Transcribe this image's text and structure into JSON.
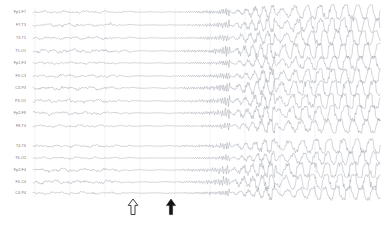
{
  "recording": {
    "modality": "EEG",
    "montage": "bipolar longitudinal (double banana)",
    "trace_color": "#8a8f99",
    "grid_color": "#cdd3da",
    "background_color": "#ffffff",
    "label_color": "#6d7480"
  },
  "channels": [
    {
      "label": "Fp1-F7",
      "group": "left-temporal"
    },
    {
      "label": "F7-T3",
      "group": "left-temporal"
    },
    {
      "label": "T3-T5",
      "group": "left-temporal"
    },
    {
      "label": "T5-O1",
      "group": "left-temporal"
    },
    {
      "label": "Fp1-F3",
      "group": "left-parasagittal"
    },
    {
      "label": "F3-C3",
      "group": "left-parasagittal"
    },
    {
      "label": "C3-P3",
      "group": "left-parasagittal"
    },
    {
      "label": "P3-O1",
      "group": "left-parasagittal"
    },
    {
      "label": "Fp2-F8",
      "group": "right-temporal"
    },
    {
      "label": "F8-T4",
      "group": "right-temporal"
    },
    {
      "label": "T4-T6",
      "group": "right-temporal"
    },
    {
      "label": "T6-O2",
      "group": "right-temporal"
    },
    {
      "label": "Fp2-F4",
      "group": "right-parasagittal"
    },
    {
      "label": "F4-C4",
      "group": "right-parasagittal"
    },
    {
      "label": "C4-P4",
      "group": "right-parasagittal"
    },
    {
      "label": "P4-O2",
      "group": "right-parasagittal"
    },
    {
      "label": "Fz-Cz",
      "group": "midline"
    },
    {
      "label": "Cz-Pz",
      "group": "midline"
    }
  ],
  "annotations": [
    {
      "name": "open-arrow-marker",
      "style": "hollow-up-arrow",
      "x": 133,
      "meaning": "electrodecremental onset"
    },
    {
      "name": "solid-arrow-marker",
      "style": "solid-up-arrow",
      "x": 171,
      "meaning": "electrographic seizure onset"
    }
  ],
  "chart_data": {
    "type": "line",
    "title": "",
    "xlabel": "",
    "ylabel": "",
    "n_channels": 15,
    "grid": true,
    "grid_x_positions": [
      35,
      70,
      105,
      140,
      175,
      210,
      245,
      280,
      315,
      350
    ],
    "x_range": [
      33,
      380
    ],
    "plot_top": 10,
    "plot_bottom": 196,
    "row_pitch": 12.3,
    "group_gap_after_row": 10,
    "group_gap_px": 7,
    "label_rows": [
      {
        "label": "Fp1-F7",
        "y": 12
      },
      {
        "label": "F7-T3",
        "y": 25
      },
      {
        "label": "T3-T5",
        "y": 38
      },
      {
        "label": "T5-O1",
        "y": 51
      },
      {
        "label": "Fp1-F3",
        "y": 63
      },
      {
        "label": "F3-C3",
        "y": 76
      },
      {
        "label": "C3-P3",
        "y": 88
      },
      {
        "label": "P3-O1",
        "y": 101
      },
      {
        "label": "Fp2-F8",
        "y": 113
      },
      {
        "label": "F8-T4",
        "y": 126
      },
      {
        "label": "T4-T6",
        "y": 146
      },
      {
        "label": "T6-O2",
        "y": 158
      },
      {
        "label": "Fp2-F4",
        "y": 170
      },
      {
        "label": "F4-C4",
        "y": 182
      },
      {
        "label": "C4-P4",
        "y": 193
      }
    ],
    "epochs": [
      {
        "name": "pre-ictal background",
        "x_start": 33,
        "x_end": 128,
        "amplitude": 1.9,
        "description": "low-amplitude mixed-frequency background activity"
      },
      {
        "name": "electrodecrement",
        "x_start": 128,
        "x_end": 171,
        "amplitude": 0.45,
        "description": "voltage attenuation / flattening following hollow arrow"
      },
      {
        "name": "low-voltage fast activity",
        "x_start": 171,
        "x_end": 230,
        "amplitude": 1.3,
        "description": "rhythmic fast activity emerging at seizure onset"
      },
      {
        "name": "rhythmic evolution",
        "x_start": 230,
        "x_end": 275,
        "amplitude": 3.2,
        "description": "build-up of rhythmic discharges with increasing amplitude"
      },
      {
        "name": "organized ictal rhythm",
        "x_start": 275,
        "x_end": 380,
        "amplitude": 5.0,
        "description": "high-amplitude organized rhythmic spike-and-wave discharges"
      }
    ]
  }
}
